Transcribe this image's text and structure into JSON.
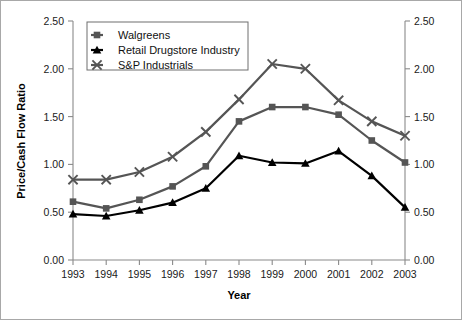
{
  "chart_data": {
    "type": "line",
    "title": "",
    "xlabel": "Year",
    "ylabel": "Price/Cash Flow Ratio",
    "categories": [
      "1993",
      "1994",
      "1995",
      "1996",
      "1997",
      "1998",
      "1999",
      "2000",
      "2001",
      "2002",
      "2003"
    ],
    "x": [
      1993,
      1994,
      1995,
      1996,
      1997,
      1998,
      1999,
      2000,
      2001,
      2002,
      2003
    ],
    "ylim": [
      0.0,
      2.5
    ],
    "xlim": [
      1993,
      2003
    ],
    "y_ticks": [
      0.0,
      0.5,
      1.0,
      1.5,
      2.0,
      2.5
    ],
    "y_tick_labels": [
      "0.00",
      "0.50",
      "1.00",
      "1.50",
      "2.00",
      "2.50"
    ],
    "x_tick_labels": [
      "1993",
      "1994",
      "1995",
      "1996",
      "1997",
      "1998",
      "1999",
      "2000",
      "2001",
      "2002",
      "2003"
    ],
    "grid": false,
    "dual_y_axis": true,
    "right_y_tick_labels": [
      "0.00",
      "0.50",
      "1.00",
      "1.50",
      "2.00",
      "2.50"
    ],
    "legend_position": "top-left",
    "series": [
      {
        "name": "Walgreens",
        "marker": "square",
        "color": "#555555",
        "values": [
          0.61,
          0.54,
          0.63,
          0.77,
          0.98,
          1.45,
          1.6,
          1.6,
          1.52,
          1.25,
          1.02
        ]
      },
      {
        "name": "Retail Drugstore Industry",
        "marker": "triangle",
        "color": "#000000",
        "values": [
          0.48,
          0.46,
          0.52,
          0.6,
          0.75,
          1.09,
          1.02,
          1.01,
          1.14,
          0.88,
          0.55
        ]
      },
      {
        "name": "S&P Industrials",
        "marker": "cross",
        "color": "#555555",
        "values": [
          0.84,
          0.84,
          0.92,
          1.08,
          1.34,
          1.68,
          2.05,
          2.0,
          1.67,
          1.45,
          1.3
        ]
      }
    ]
  },
  "axis": {
    "y_title": "Price/Cash Flow Ratio",
    "x_title": "Year"
  },
  "legend": {
    "entries": [
      {
        "label": "Walgreens"
      },
      {
        "label": "Retail Drugstore Industry"
      },
      {
        "label": "S&P Industrials"
      }
    ]
  },
  "colors": {
    "series_gray": "#555555",
    "series_black": "#000000",
    "axis": "#8a8a8a",
    "border": "#a8a8a8",
    "background": "#ffffff"
  }
}
